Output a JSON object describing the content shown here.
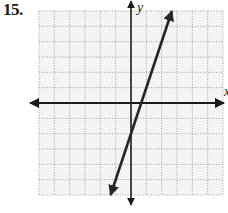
{
  "problem": {
    "number": "15."
  },
  "axes": {
    "x_label": "x",
    "y_label": "y"
  },
  "colors": {
    "grid": "#9a9a9a",
    "grid_bg": "#f3f3f3",
    "axis": "#1a1a1a",
    "line": "#262626"
  },
  "chart_data": {
    "type": "line",
    "title": "",
    "xlabel": "x",
    "ylabel": "y",
    "xlim": [
      -6,
      6
    ],
    "ylim": [
      -6,
      6
    ],
    "grid": true,
    "grid_step": 1,
    "tick_labels": false,
    "legend": null,
    "series": [
      {
        "name": "y = 3x - 2",
        "equation": "y = 3x - 2",
        "slope": 3,
        "intercept": -2,
        "x": [
          -1.333,
          0,
          0.667,
          1,
          2,
          2.667
        ],
        "y": [
          -6,
          -2,
          0,
          1,
          4,
          6
        ],
        "arrows": "both"
      }
    ],
    "annotations": [
      {
        "text": "y-intercept at (0, -2)"
      },
      {
        "text": "x-intercept at (2/3, 0)"
      }
    ]
  }
}
